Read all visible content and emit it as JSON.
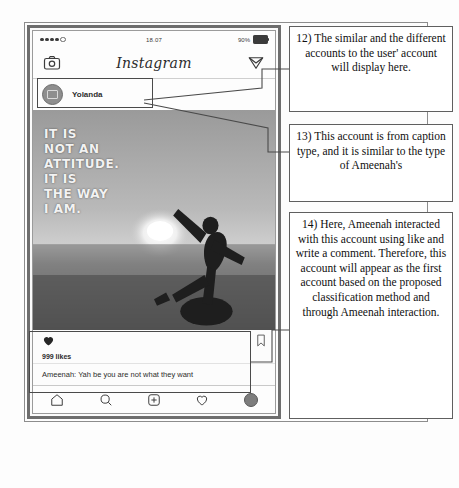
{
  "figure": {
    "caption_overlay": "IT IS\nNOT AN\nATTITUDE.\nIT IS\nTHE WAY\nI AM."
  },
  "phone": {
    "status_bar": {
      "time": "18.07",
      "battery_percent": "90%",
      "signal_dots_filled": 4,
      "signal_dots_hollow": 1
    },
    "app_header": {
      "camera_icon": "camera-icon",
      "title": "Instagram",
      "direct_icon": "paper-plane-icon"
    },
    "story_row": {
      "avatar_icon": "account-avatar",
      "username": "Yolanda"
    },
    "post": {
      "photo_alt": "silhouette-person-sunset",
      "like_icon": "heart-filled-icon",
      "bookmark_icon": "bookmark-icon",
      "likes": "999 likes",
      "comment": "Ameenah: Yah be you are not what they want"
    },
    "tab_bar": {
      "home": "home-icon",
      "search": "search-icon",
      "add": "plus-circle-icon",
      "activity": "heart-outline-icon",
      "profile": "profile-avatar-icon"
    }
  },
  "annotations": [
    {
      "id": "12",
      "text": "12) The similar and the different accounts to the user' account will display here."
    },
    {
      "id": "13",
      "text": "13) This account is from caption type, and it is similar to the type of Ameenah's"
    },
    {
      "id": "14",
      "text": "14) Here, Ameenah interacted with this account using like and write a comment. Therefore, this account will appear as the first account based on the proposed classification method and through Ameenah interaction."
    }
  ],
  "colors": {
    "ink": "#0f0f0f",
    "frame": "#6e6e6e",
    "highlight": "#4a4a4a",
    "paper": "#ffffff"
  }
}
